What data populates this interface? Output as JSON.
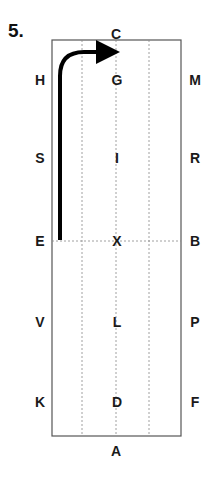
{
  "exercise_number": "5.",
  "arena": {
    "top_marker": "C",
    "bottom_marker": "A",
    "left_markers": [
      "H",
      "S",
      "E",
      "V",
      "K"
    ],
    "center_markers": [
      "G",
      "I",
      "X",
      "L",
      "D"
    ],
    "right_markers": [
      "M",
      "R",
      "B",
      "P",
      "F"
    ]
  },
  "route": {
    "description": "Start at E, track up the left side, turn at the top toward C, ending with arrow",
    "from": "E",
    "to": "C",
    "color": "#000000"
  }
}
